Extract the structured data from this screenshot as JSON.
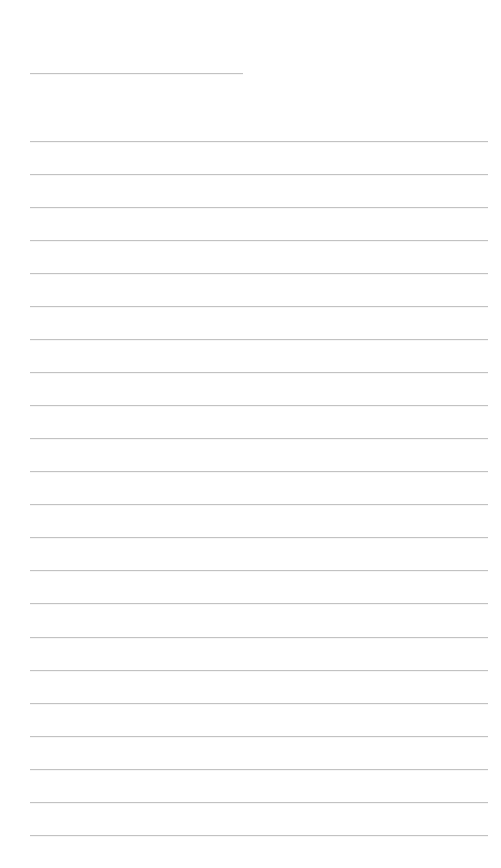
{
  "page": {
    "background_color": "#ffffff",
    "width": 501,
    "height": 868
  },
  "ruling": {
    "line_color": "#c2c2c2",
    "line_thickness": 1,
    "left_margin": 30,
    "right_margin": 488,
    "spacing": 33.0
  },
  "lines": [
    {
      "id": "rule-1",
      "y": 73,
      "x1": 30,
      "x2": 243,
      "kind": "short",
      "text": ""
    },
    {
      "id": "rule-2",
      "y": 141,
      "x1": 30,
      "x2": 488,
      "kind": "full",
      "text": ""
    },
    {
      "id": "rule-3",
      "y": 174,
      "x1": 30,
      "x2": 488,
      "kind": "full",
      "text": ""
    },
    {
      "id": "rule-4",
      "y": 207,
      "x1": 30,
      "x2": 488,
      "kind": "full",
      "text": ""
    },
    {
      "id": "rule-5",
      "y": 240,
      "x1": 30,
      "x2": 488,
      "kind": "full",
      "text": ""
    },
    {
      "id": "rule-6",
      "y": 273,
      "x1": 30,
      "x2": 488,
      "kind": "full",
      "text": ""
    },
    {
      "id": "rule-7",
      "y": 306,
      "x1": 30,
      "x2": 488,
      "kind": "full",
      "text": ""
    },
    {
      "id": "rule-8",
      "y": 339,
      "x1": 30,
      "x2": 488,
      "kind": "full",
      "text": ""
    },
    {
      "id": "rule-9",
      "y": 372,
      "x1": 30,
      "x2": 488,
      "kind": "full",
      "text": ""
    },
    {
      "id": "rule-10",
      "y": 405,
      "x1": 30,
      "x2": 488,
      "kind": "full",
      "text": ""
    },
    {
      "id": "rule-11",
      "y": 438,
      "x1": 30,
      "x2": 488,
      "kind": "full",
      "text": ""
    },
    {
      "id": "rule-12",
      "y": 471,
      "x1": 30,
      "x2": 488,
      "kind": "full",
      "text": ""
    },
    {
      "id": "rule-13",
      "y": 504,
      "x1": 30,
      "x2": 488,
      "kind": "full",
      "text": ""
    },
    {
      "id": "rule-14",
      "y": 537,
      "x1": 30,
      "x2": 488,
      "kind": "full",
      "text": ""
    },
    {
      "id": "rule-15",
      "y": 570,
      "x1": 30,
      "x2": 488,
      "kind": "full",
      "text": ""
    },
    {
      "id": "rule-16",
      "y": 603,
      "x1": 30,
      "x2": 488,
      "kind": "full",
      "text": ""
    },
    {
      "id": "rule-17",
      "y": 637,
      "x1": 30,
      "x2": 488,
      "kind": "full",
      "text": ""
    },
    {
      "id": "rule-18",
      "y": 670,
      "x1": 30,
      "x2": 488,
      "kind": "full",
      "text": ""
    },
    {
      "id": "rule-19",
      "y": 703,
      "x1": 30,
      "x2": 488,
      "kind": "full",
      "text": ""
    },
    {
      "id": "rule-20",
      "y": 736,
      "x1": 30,
      "x2": 488,
      "kind": "full",
      "text": ""
    },
    {
      "id": "rule-21",
      "y": 769,
      "x1": 30,
      "x2": 488,
      "kind": "full",
      "text": ""
    },
    {
      "id": "rule-22",
      "y": 802,
      "x1": 30,
      "x2": 488,
      "kind": "full",
      "text": ""
    },
    {
      "id": "rule-23",
      "y": 835,
      "x1": 30,
      "x2": 488,
      "kind": "full",
      "text": ""
    }
  ]
}
